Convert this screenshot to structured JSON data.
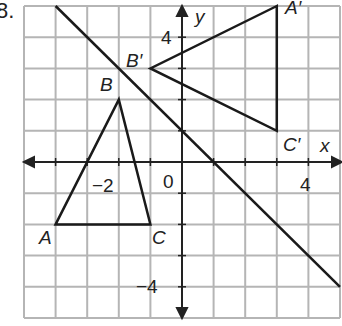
{
  "problem_number": "8.",
  "graph": {
    "x_range": [
      -5,
      5
    ],
    "y_range": [
      -5,
      5
    ],
    "grid_step": 1,
    "axis_labels": {
      "x": "x",
      "y": "y"
    },
    "tick_labels": {
      "x_neg": "−2",
      "x_pos": "4",
      "origin": "0",
      "y_pos": "4",
      "y_neg": "−4"
    },
    "line_of_reflection": {
      "equation": "y = -x + 1",
      "from": [
        -4,
        5
      ],
      "to": [
        5,
        -4
      ]
    },
    "triangle_original": {
      "vertices": {
        "A": [
          -4,
          -2
        ],
        "B": [
          -2,
          2
        ],
        "C": [
          -1,
          -2
        ]
      },
      "labels": {
        "A": "A",
        "B": "B",
        "C": "C"
      }
    },
    "triangle_image": {
      "vertices": {
        "A'": [
          3,
          5
        ],
        "B'": [
          -1,
          3
        ],
        "C'": [
          3,
          1
        ]
      },
      "labels": {
        "A'": "A′",
        "B'": "B′",
        "C'": "C′"
      }
    },
    "colors": {
      "grid": "#b5b5b5",
      "axes": "#222222",
      "figures": "#1a1a1a",
      "background": "#ffffff"
    }
  }
}
